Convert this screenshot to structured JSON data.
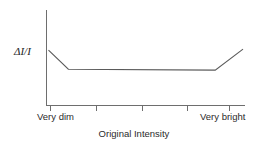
{
  "chart_data": {
    "type": "line",
    "title": "",
    "xlabel": "Original Intensity",
    "ylabel": "ΔI/I",
    "grid": false,
    "legend": null,
    "xlim": [
      0,
      100
    ],
    "ylim": [
      0,
      100
    ],
    "x_tick_labels": [
      "Very dim",
      "Very bright"
    ],
    "x_tick_count": 5,
    "x_ticks": [
      2,
      25,
      48,
      71,
      92
    ],
    "y_ticks": [],
    "annotation": "",
    "series": [
      {
        "name": "Weber fraction",
        "x": [
          1,
          11,
          85,
          99
        ],
        "values": [
          58,
          38,
          37,
          59
        ]
      }
    ]
  },
  "labels": {
    "y_axis": "ΔI/I",
    "x_axis_title": "Original Intensity",
    "x_left": "Very dim",
    "x_right": "Very bright"
  },
  "colors": {
    "background": "#ffffff",
    "axis": "#6e6e6e",
    "curve": "#5a5a5a",
    "text": "#2b2b2b"
  }
}
